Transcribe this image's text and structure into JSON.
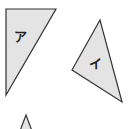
{
  "diagram": {
    "shapes": [
      {
        "id": "triangle-a",
        "label": "ア",
        "points": "6,9 56,9 6,95",
        "fill": "#e4e4e4",
        "stroke": "#333333",
        "label_pos": [
          14,
          40
        ]
      },
      {
        "id": "triangle-i",
        "label": "イ",
        "points": "100,20 72,70 122,102",
        "fill": "#e4e4e4",
        "stroke": "#333333",
        "label_pos": [
          89,
          68
        ]
      },
      {
        "id": "triangle-partial",
        "label": "",
        "points": "26,115 19,131 33,131",
        "fill": "#e4e4e4",
        "stroke": "#333333",
        "label_pos": [
          0,
          0
        ]
      }
    ]
  }
}
